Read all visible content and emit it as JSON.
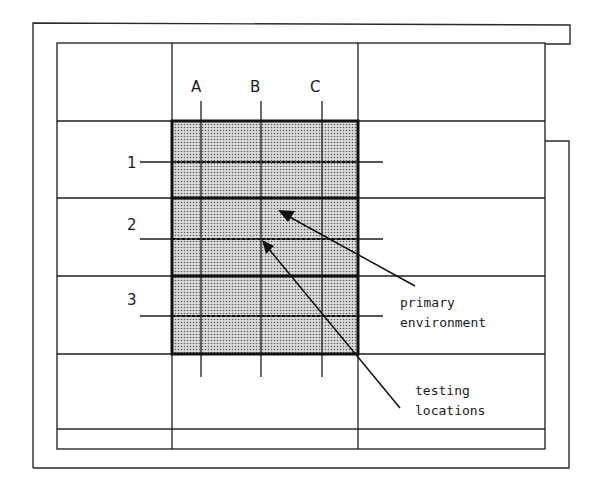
{
  "diagram": {
    "columns": [
      "A",
      "B",
      "C"
    ],
    "rows": [
      "1",
      "2",
      "3"
    ],
    "annotations": {
      "primary": {
        "line1": "primary",
        "line2": "environment"
      },
      "testing": {
        "line1": "testing",
        "line2": "locations"
      }
    },
    "colors": {
      "shade_dot": "#6a6a6a",
      "shade_bg": "#d9d9d9",
      "line": "#1e1e1e"
    }
  }
}
